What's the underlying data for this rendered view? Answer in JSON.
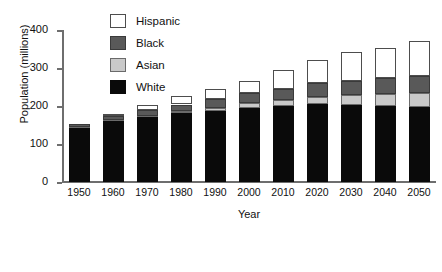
{
  "chart_data": {
    "type": "bar",
    "stacked": true,
    "title": "",
    "xlabel": "Year",
    "ylabel": "Population (millions)",
    "categories": [
      "1950",
      "1960",
      "1970",
      "1980",
      "1990",
      "2000",
      "2010",
      "2020",
      "2030",
      "2040",
      "2050"
    ],
    "ylim": [
      0,
      400
    ],
    "yticks": [
      0,
      100,
      200,
      300,
      400
    ],
    "ytick_labels": [
      "0",
      "100",
      "200",
      "300",
      "400"
    ],
    "grid": false,
    "legend_position": "top-left-inside",
    "series": [
      {
        "name": "White",
        "color": "#0a0a0a",
        "values": [
          143,
          160,
          171,
          181,
          188,
          196,
          201,
          205,
          203,
          200,
          197
        ]
      },
      {
        "name": "Asian",
        "color": "#c9c9c9",
        "values": [
          1,
          2,
          3,
          5,
          8,
          11,
          15,
          20,
          25,
          31,
          36
        ]
      },
      {
        "name": "Black",
        "color": "#595959",
        "values": [
          8,
          11,
          15,
          18,
          22,
          26,
          30,
          35,
          39,
          43,
          47
        ]
      },
      {
        "name": "Hispanic",
        "color": "#ffffff",
        "values": [
          0,
          6,
          13,
          22,
          28,
          34,
          48,
          62,
          76,
          80,
          90
        ]
      }
    ],
    "totals": [
      152,
      179,
      202,
      226,
      246,
      267,
      294,
      322,
      343,
      354,
      370
    ]
  },
  "legend": {
    "entries": [
      {
        "label": "Hispanic",
        "swatch": "sw-hispanic"
      },
      {
        "label": "Black",
        "swatch": "sw-black"
      },
      {
        "label": "Asian",
        "swatch": "sw-asian"
      },
      {
        "label": "White",
        "swatch": "sw-white"
      }
    ]
  }
}
